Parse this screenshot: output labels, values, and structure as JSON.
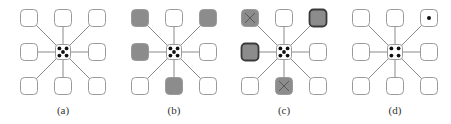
{
  "figure": {
    "colors": {
      "line": "#8a8a8a",
      "box_border": "#9a9a9a",
      "box_fill_empty": "#ffffff",
      "box_fill_shaded": "#8c8c8c",
      "box_border_bold": "#3a3a3a",
      "dot": "#111111",
      "cross": "#5a5a5a"
    },
    "panels": [
      {
        "label": "(a)",
        "center_dots": 5,
        "neighbors": {
          "top-left": "empty",
          "top": "empty",
          "top-right": "empty",
          "left": "empty",
          "right": "empty",
          "bottom-left": "empty",
          "bottom": "empty",
          "bottom-right": "empty"
        }
      },
      {
        "label": "(b)",
        "center_dots": 5,
        "neighbors": {
          "top-left": "shaded",
          "top": "empty",
          "top-right": "shaded",
          "left": "shaded",
          "right": "empty",
          "bottom-left": "empty",
          "bottom": "shaded",
          "bottom-right": "empty"
        }
      },
      {
        "label": "(c)",
        "center_dots": 5,
        "neighbors": {
          "top-left": "shaded-crossed",
          "top": "empty",
          "top-right": "shaded-bold",
          "left": "shaded-bold",
          "right": "empty",
          "bottom-left": "empty",
          "bottom": "shaded-crossed",
          "bottom-right": "empty"
        }
      },
      {
        "label": "(d)",
        "center_dots": 4,
        "neighbors": {
          "top-left": "empty",
          "top": "empty",
          "top-right": "empty-dot",
          "left": "empty",
          "right": "empty",
          "bottom-left": "empty",
          "bottom": "empty",
          "bottom-right": "empty"
        }
      }
    ]
  }
}
